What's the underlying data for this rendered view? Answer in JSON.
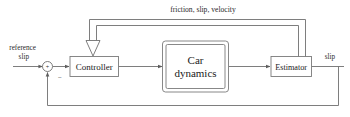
{
  "diagram": {
    "title_text": "",
    "colors": {
      "line": "#6f6f6f",
      "box_stroke": "#7a7a7a",
      "box_fill": "#ffffff",
      "text": "#1a1a1a",
      "background": "#ffffff"
    },
    "blocks": [
      {
        "id": "controller",
        "label": "Controller"
      },
      {
        "id": "car_dynamics",
        "label_line1": "Car",
        "label_line2": "dynamics"
      },
      {
        "id": "estimator",
        "label": "Estimator"
      }
    ],
    "summing_junction": {
      "name": "summing-junction",
      "plus_sign": "+",
      "minus_sign": "−"
    },
    "signals": {
      "input_line1": "reference",
      "input_line2": "slip",
      "output": "slip",
      "feedback_bus": "friction, slip, velocity"
    }
  }
}
